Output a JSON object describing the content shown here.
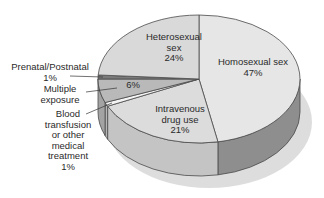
{
  "chart_data": {
    "type": "pie",
    "style": "3d-exploded-perspective",
    "title": "",
    "start_angle_deg": 0,
    "direction": "clockwise",
    "slices": [
      {
        "label": "Homosexual sex",
        "value": 47,
        "display": "Homosexual sex\n47%",
        "top_color": "#e6e6e6",
        "side_color": "#8e8e8e"
      },
      {
        "label": "Intravenous drug use",
        "value": 21,
        "display": "Intravenous\ndrug use\n21%",
        "top_color": "#dcdcdc",
        "side_color": "#c4c4c4"
      },
      {
        "label": "Blood transfusion or other medical treatment",
        "value": 1,
        "display": "Blood\ntransfusion\nor other\nmedical\ntreatment\n1%",
        "top_color": "#f4f4f4",
        "side_color": "#b8b8b8"
      },
      {
        "label": "Multiple exposure",
        "value": 6,
        "display": "6%",
        "top_color": "#b9b9b9",
        "side_color": "#a3a3a3"
      },
      {
        "label": "Prenatal/Postnatal",
        "value": 1,
        "display": "Prenatal/Postnatal\n1%",
        "top_color": "#7a7a7a",
        "side_color": "#6a6a6a"
      },
      {
        "label": "Heterosexual sex",
        "value": 24,
        "display": "Heterosexual\nsex\n24%",
        "top_color": "#d9d9d9",
        "side_color": "#b0b0b0"
      }
    ],
    "legend": "none (direct labels)",
    "external_labels": {
      "prenatal": "Prenatal/Postnatal\n1%",
      "multiple": "Multiple\nexposure",
      "blood": "Blood\ntransfusion\nor other\nmedical\ntreatment\n1%"
    }
  },
  "colors": {
    "outline": "#4a4a4a",
    "shadow": "#d4d4d4",
    "text": "#2a2a2a"
  }
}
